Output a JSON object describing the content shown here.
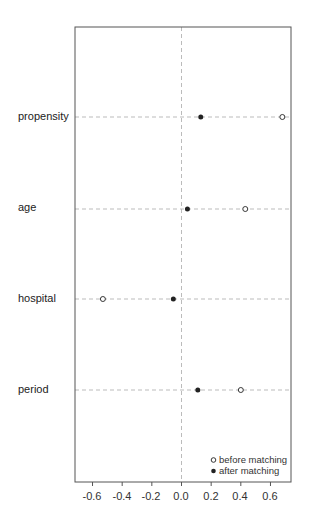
{
  "chart_data": {
    "type": "scatter",
    "subtype": "dot-plot (covariate balance)",
    "title": "",
    "xlabel": "",
    "ylabel": "",
    "xlim": [
      -0.73,
      0.74
    ],
    "xticks": [
      -0.6,
      -0.4,
      -0.2,
      0.0,
      0.2,
      0.4,
      0.6
    ],
    "xtick_labels": [
      "-0.6",
      "-0.4",
      "-0.2",
      "0.0",
      "0.2",
      "0.4",
      "0.6"
    ],
    "categories": [
      "propensity",
      "age",
      "hospital",
      "period"
    ],
    "series": [
      {
        "name": "before matching",
        "marker": "open-circle",
        "values": [
          0.68,
          0.43,
          -0.53,
          0.4
        ]
      },
      {
        "name": "after matching",
        "marker": "filled-circle",
        "values": [
          0.13,
          0.04,
          -0.055,
          0.11
        ]
      }
    ],
    "reference_line": {
      "x": 0.0,
      "style": "dashed",
      "color": "#bbbbbb"
    },
    "row_guides": {
      "style": "dashed",
      "color": "#bbbbbb"
    },
    "grid": false,
    "legend": {
      "position": "bottom-right inside",
      "entries": [
        "before matching",
        "after matching"
      ]
    }
  },
  "labels": {
    "rows": [
      "propensity",
      "age",
      "hospital",
      "period"
    ],
    "legend_before": "before matching",
    "legend_after": "after matching",
    "ticks": [
      "-0.6",
      "-0.4",
      "-0.2",
      "0.0",
      "0.2",
      "0.4",
      "0.6"
    ]
  },
  "colors": {
    "frame": "#555555",
    "guide": "#bbbbbb",
    "point": "#222222"
  }
}
